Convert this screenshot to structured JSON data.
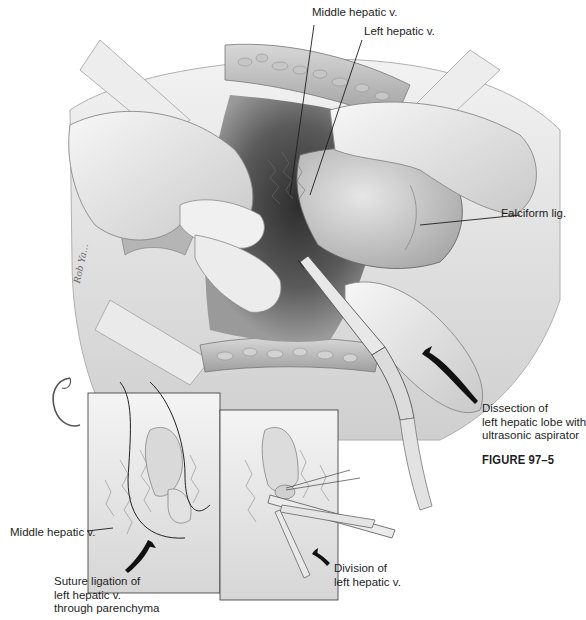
{
  "figure": {
    "title": "FIGURE 97–5",
    "artist_signature": "Rob Ya..."
  },
  "main_illustration": {
    "description": "Dissection of left hepatic lobe with ultrasonic aspirator",
    "labels": [
      {
        "id": "middle-hepatic-v-top",
        "text": "Middle hepatic v."
      },
      {
        "id": "left-hepatic-v-top",
        "text": "Left hepatic v."
      },
      {
        "id": "falciform-lig",
        "text": "Falciform lig."
      },
      {
        "id": "dissection",
        "text": "Dissection of\nleft hepatic lobe with\nultrasonic aspirator"
      }
    ]
  },
  "inset_left": {
    "labels": [
      {
        "id": "middle-hepatic-v-inset",
        "text": "Middle hepatic v."
      },
      {
        "id": "suture-ligation",
        "text": "Suture ligation of\nleft hepatic v.\nthrough parenchyma"
      }
    ]
  },
  "inset_right": {
    "labels": [
      {
        "id": "division",
        "text": "Division of\nleft hepatic v."
      }
    ]
  },
  "colors": {
    "background": "#ffffff",
    "ink": "#1e1e1e",
    "tissue_light": "#e4e4e4",
    "tissue_mid": "#b9b9b9",
    "tissue_dark": "#5a5a5a",
    "cavity": "#3c3c3c"
  }
}
